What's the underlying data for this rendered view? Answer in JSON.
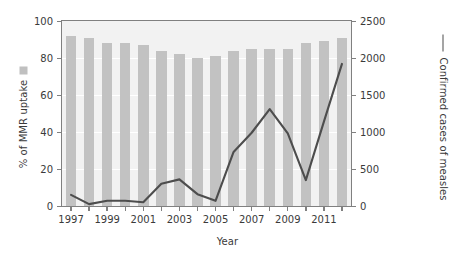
{
  "chart_data": {
    "type": "bar",
    "title": "",
    "subtitle": "",
    "xlabel": "Year",
    "ylabel": "% of MMR uptake",
    "y2label": "Confirmed cases of measles",
    "grid": true,
    "legend_position": "axis-labels",
    "categories": [
      1997,
      1998,
      1999,
      2000,
      2001,
      2002,
      2003,
      2004,
      2005,
      2006,
      2007,
      2008,
      2009,
      2010,
      2011,
      2012
    ],
    "x": [
      "1997",
      "1998",
      "1999",
      "2000",
      "2001",
      "2002",
      "2003",
      "2004",
      "2005",
      "2006",
      "2007",
      "2008",
      "2009",
      "2010",
      "2011",
      "2012"
    ],
    "xtick_labels": [
      "1997",
      "",
      "1999",
      "",
      "2001",
      "",
      "2003",
      "",
      "2005",
      "",
      "2007",
      "",
      "2009",
      "",
      "2011",
      ""
    ],
    "ylim": [
      0,
      100
    ],
    "ytick_labels": [
      "0",
      "20",
      "40",
      "60",
      "80",
      "100"
    ],
    "ytick_values": [
      0,
      20,
      40,
      60,
      80,
      100
    ],
    "y2lim": [
      0,
      2500
    ],
    "y2tick_labels": [
      "0",
      "500",
      "1000",
      "1500",
      "2000",
      "2500"
    ],
    "y2tick_values": [
      0,
      500,
      1000,
      1500,
      2000,
      2500
    ],
    "series": [
      {
        "name": "% of MMR uptake",
        "type": "bar",
        "axis": "left",
        "color": "#c2c2c2",
        "values": [
          92,
          91,
          88,
          88,
          87,
          84,
          82,
          80,
          81,
          84,
          85,
          85,
          85,
          88,
          89,
          91
        ]
      },
      {
        "name": "Confirmed cases of measles",
        "type": "line",
        "axis": "right",
        "color": "#4d4d4d",
        "values": [
          150,
          25,
          70,
          70,
          50,
          300,
          360,
          160,
          70,
          730,
          990,
          1310,
          980,
          350,
          1140,
          1920
        ]
      }
    ],
    "legend": [
      {
        "label": "% of MMR uptake",
        "marker": "square",
        "color": "#c2c2c2"
      },
      {
        "label": "Confirmed cases of measles",
        "marker": "line",
        "color": "#4d4d4d"
      }
    ]
  },
  "colors": {
    "bar": "#c2c2c2",
    "line": "#4d4d4d",
    "plot_background": "#f2f2f2",
    "grid": "#ffffff",
    "axis": "#808080",
    "text": "#3a3a3a"
  }
}
